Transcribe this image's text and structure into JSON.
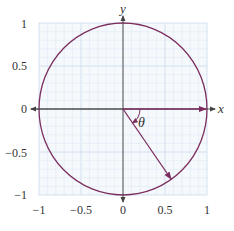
{
  "diagram": {
    "type": "unit-circle",
    "axes": {
      "x_label": "x",
      "y_label": "y",
      "x_ticks": [
        "−1",
        "−0.5",
        "0",
        "0.5",
        "1"
      ],
      "y_ticks": [
        "1",
        "0.5",
        "0",
        "−0.5",
        "−1"
      ],
      "range": [
        -1,
        1
      ]
    },
    "angle_label": "θ",
    "vectors": [
      {
        "name": "reference-vector",
        "from": [
          0,
          0
        ],
        "to": [
          1,
          0
        ]
      },
      {
        "name": "rotated-vector",
        "from": [
          0,
          0
        ],
        "to": [
          0.57,
          -0.82
        ]
      }
    ],
    "colors": {
      "curve": "#7b2d5e",
      "axes": "#555555",
      "grid_minor": "#e3edf6",
      "grid_major": "#c9dbec",
      "text": "#333333"
    }
  }
}
